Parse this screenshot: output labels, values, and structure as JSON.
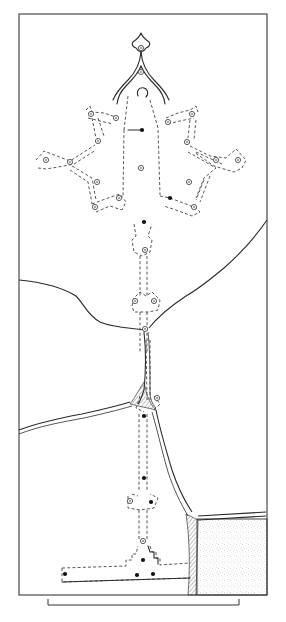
{
  "figure": {
    "type": "archaeological site plan (line drawing)",
    "width": 286,
    "height": 622,
    "colors": {
      "ink": "#2a2a2a",
      "paper": "#ffffff",
      "stipple": "#8a8a8a"
    }
  },
  "frame": {
    "x": 19,
    "y": 14,
    "w": 248,
    "h": 581
  },
  "scale_bar": {
    "x1": 48,
    "x2": 239,
    "y": 605,
    "tick_height": 6
  },
  "dressing_room_outline": {
    "finial_path": "M141 33 C139 38 136 40 133 42 C131 44 133 47 136 48 C137 50 138 51 141 52 C144 51 145 50 146 48 C149 47 151 44 149 42 C146 40 143 38 141 33 Z",
    "arch_outer_left": "M141 52 C140 64 136 72 128 80 C122 86 116 92 113 100",
    "arch_inner_left": "M141 66 C138 74 132 80 126 86 C121 91 118 96 117 104",
    "arch_outer_right": "M141 52 C142 64 146 72 154 80 C160 86 166 92 169 100",
    "arch_inner_right": "M141 66 C144 74 150 80 156 86 C161 91 164 96 165 104",
    "keyhole": "M138 96 C136 90 140 87 144 88 C148 89 149 94 146 97"
  },
  "corridor": {
    "central_hall": "M124 130 L128 96 M150 100 L158 128 L160 195 M124 130 L123 196",
    "central_ring": {
      "x": 141,
      "y": 168
    },
    "lever_dot": {
      "x": 142,
      "y": 130,
      "line_x1": 128
    }
  },
  "lobes": [
    {
      "name": "top-left",
      "path": "M86 110 L90 106 L92 112 L104 113 L116 117 M88 118 L100 121 L113 124",
      "rings": [
        [
          91,
          114
        ],
        [
          116,
          118
        ]
      ]
    },
    {
      "name": "left-upper-arm",
      "path": "M92 118 L96 138 M98 118 L104 136",
      "rings": [
        [
          98,
          141
        ]
      ]
    },
    {
      "name": "left",
      "path": "M36 160 L44 151 L62 158 L70 161 L95 145 M38 168 L46 169 L64 166 L74 164 L96 150",
      "rings": [
        [
          46,
          160
        ],
        [
          70,
          162
        ]
      ]
    },
    {
      "name": "left-lower-arm",
      "path": "M72 166 L92 178 L96 200 M70 170 L88 182 L92 204",
      "rings": [
        [
          97,
          182
        ]
      ]
    },
    {
      "name": "bottom-left",
      "path": "M92 204 L108 198 L120 194 L126 202 L122 210 M96 212 L110 206 L122 210",
      "rings": [
        [
          95,
          207
        ],
        [
          119,
          198
        ]
      ]
    },
    {
      "name": "top-right",
      "path": "M166 118 L178 113 L190 110 L196 106 L198 112 M168 124 L180 121 L194 118",
      "rings": [
        [
          168,
          122
        ],
        [
          192,
          114
        ]
      ]
    },
    {
      "name": "right-upper-arm",
      "path": "M190 120 L188 138 M196 120 L194 140",
      "rings": [
        [
          187,
          142
        ]
      ]
    },
    {
      "name": "right",
      "path": "M190 146 L210 156 L226 158 L236 149 L246 160 L242 168 L234 172 L214 166 L194 152 M188 152 L216 168 L204 178 L196 198 M196 152 L222 164",
      "rings": [
        [
          216,
          160
        ],
        [
          238,
          160
        ]
      ]
    },
    {
      "name": "right-lower-arm",
      "path": "M204 180 L196 200 M210 176 L200 202",
      "rings": [
        [
          189,
          182
        ]
      ]
    },
    {
      "name": "bottom-right",
      "path": "M160 196 L170 198 L186 204 L196 208 L200 212 L192 216 L176 210 L164 206",
      "rings": [
        [
          194,
          207
        ]
      ]
    }
  ],
  "dots_upper": [
    [
      170,
      198
    ],
    [
      144,
      222
    ]
  ],
  "shaft": {
    "upper_path": "M134 224 L136 236 L132 240 L134 252 L142 256 L150 252 L152 240 L148 236 L152 224 M140 256 L140 296 M147 256 L147 296",
    "upper_rings": [
      [
        145,
        250
      ]
    ],
    "mid_chamber_path": "M134 298 L132 306 L134 312 L140 312 L148 312 L158 310 L160 300 L152 292 L146 296 L140 292 Z M140 312 L140 352 M147 312 L147 352",
    "mid_rings": [
      [
        135,
        301
      ],
      [
        154,
        301
      ]
    ],
    "junction_ring": [
      145,
      329
    ],
    "lower_path": "M146 340 L147 400 M150 340 L150 400 M140 396 L136 408 L144 412 M154 396 L160 404 L154 410",
    "lower_rings": [
      [
        157,
        398
      ]
    ],
    "lower_shaft": "M139 414 L139 490 M147 414 L147 490",
    "lower_dots": [
      [
        144,
        416
      ],
      [
        144,
        478
      ]
    ],
    "small_chamber": "M128 496 L128 508 L140 510 L154 508 L158 498 L150 494 M132 494 L138 496",
    "small_chamber_marks": {
      "ring": [
        130,
        501
      ],
      "dot": [
        151,
        502
      ]
    },
    "post_shaft": "M139 510 L139 540 M147 510 L147 540",
    "post_ring": [
      143,
      541
    ]
  },
  "burial_chamber": {
    "outline": "M62 568 L126 566 L126 560 L132 560 L132 554 L136 554 L138 546 M150 546 L152 552 L156 552 L156 558 L160 558 L160 565 L190 563 M62 568 L62 582 L190 578",
    "steps_path": "M148 546 L150 552 L154 552 L154 558 L158 558 L158 564",
    "dots": [
      [
        143,
        560
      ],
      [
        65,
        574
      ],
      [
        137,
        575
      ],
      [
        153,
        574
      ]
    ]
  },
  "cracks": {
    "left_upper": "M19 280 C40 282 60 286 76 296 C84 304 88 316 100 322 C114 328 132 328 144 330",
    "right_upper": "M149 328 C160 314 174 304 186 296 C200 288 212 278 224 268 C240 254 256 236 267 220",
    "left_lower": "M19 430 C40 422 60 418 82 414 C100 410 118 406 130 402",
    "left_lower_b": "M19 434 C40 426 62 422 84 418 C102 414 118 410 132 406",
    "vertical": "M144 332 C146 350 146 370 144 390 C142 396 140 402 138 404",
    "vertical_b": "M148 332 C150 350 150 372 150 392 C150 398 152 404 156 408",
    "right_lower": "M156 410 C160 430 166 450 172 470 C178 488 184 500 192 512",
    "right_lower_b": "M152 412 C158 432 162 452 168 472 C174 490 180 502 188 516",
    "right_edge": "M198 516 L266 512 M198 520 L266 516"
  },
  "hatched_regions": [
    "M130 404 C136 396 140 388 144 382 C146 392 148 402 156 410 C148 408 138 406 130 404 Z",
    "M186 514 C190 516 194 518 198 520 L196 595 L188 595 C190 570 190 540 186 514 Z"
  ],
  "stippled_region": {
    "x": 197,
    "y": 519,
    "w": 70,
    "h": 76
  }
}
